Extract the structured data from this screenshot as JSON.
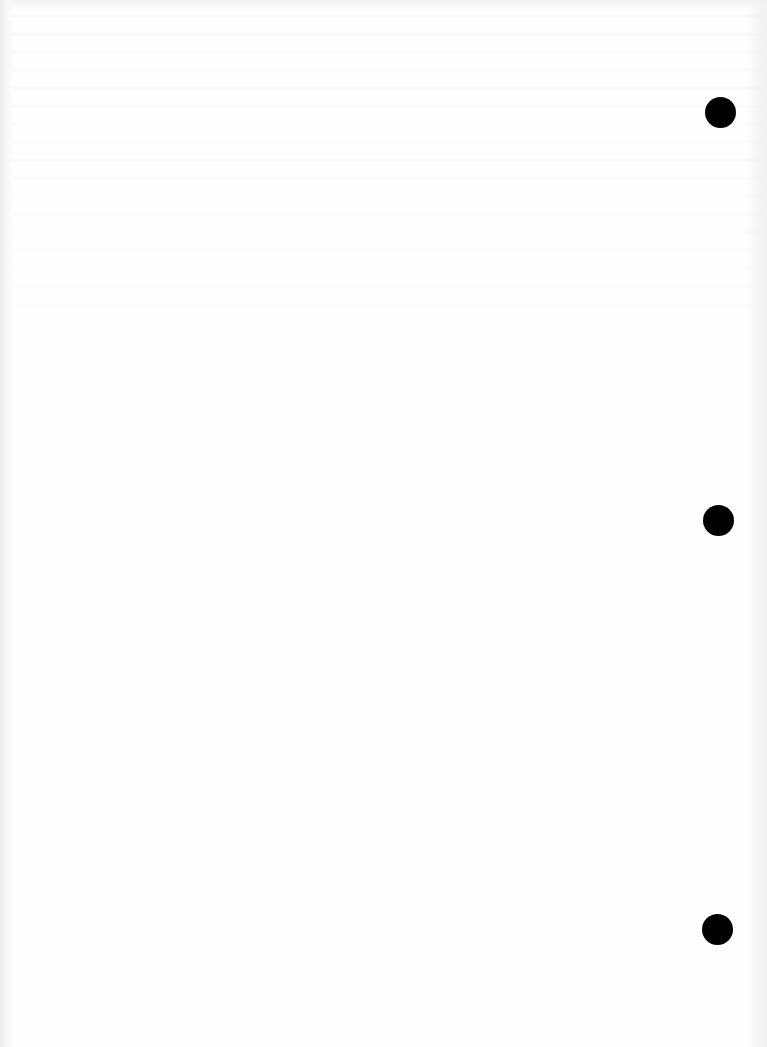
{
  "page": {
    "type": "blank-scanned-sheet",
    "background_color": "#fefefe",
    "text": ""
  },
  "binder_holes": [
    {
      "cx": 720,
      "cy": 112,
      "diameter": 31,
      "color": "#000000"
    },
    {
      "cx": 718,
      "cy": 520,
      "diameter": 31,
      "color": "#000000"
    },
    {
      "cx": 717,
      "cy": 929,
      "diameter": 31,
      "color": "#000000"
    }
  ]
}
